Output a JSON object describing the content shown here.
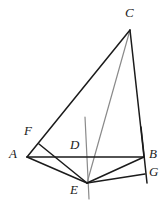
{
  "figure": {
    "type": "geometry-diagram",
    "canvas": {
      "width": 165,
      "height": 205,
      "background": "#ffffff"
    },
    "colors": {
      "stroke_dark": "#1b1b1b",
      "stroke_gray": "#8a8a8a",
      "label_color": "#1b1b1b",
      "background": "#ffffff"
    },
    "points": [
      {
        "id": "C",
        "label": "C",
        "x": 130,
        "y": 30,
        "label_x": 128,
        "label_y": 8,
        "anchor": "top"
      },
      {
        "id": "F",
        "label": "F",
        "x": 39,
        "y": 144,
        "label_x": 25,
        "label_y": 126,
        "anchor": "left"
      },
      {
        "id": "A",
        "label": "A",
        "x": 27,
        "y": 157,
        "label_x": 11,
        "label_y": 148,
        "anchor": "left"
      },
      {
        "id": "D",
        "label": "D",
        "x": 79,
        "y": 157,
        "label_x": 71,
        "label_y": 139,
        "anchor": "above"
      },
      {
        "id": "B",
        "label": "B",
        "x": 144,
        "y": 157,
        "label_x": 148,
        "label_y": 148,
        "anchor": "right"
      },
      {
        "id": "G",
        "label": "G",
        "x": 144,
        "y": 174,
        "label_x": 148,
        "label_y": 166,
        "anchor": "right"
      },
      {
        "id": "E",
        "label": "E",
        "x": 87,
        "y": 183,
        "label_x": 71,
        "label_y": 183,
        "anchor": "below-left"
      }
    ],
    "segments": [
      {
        "id": "AC",
        "from": "A",
        "to": "C",
        "color": "stroke_dark",
        "width": 1.5,
        "note": "side A to C passing through F"
      },
      {
        "id": "CB",
        "from": "C",
        "to": "B",
        "color": "stroke_dark",
        "width": 1.5,
        "note": "side C to B"
      },
      {
        "id": "AB",
        "from": "A",
        "to": "B",
        "color": "stroke_dark",
        "width": 1.5,
        "note": "base A to B through D"
      },
      {
        "id": "AE",
        "from": "A",
        "to": "E",
        "color": "stroke_dark",
        "width": 1.5,
        "note": "A down to E"
      },
      {
        "id": "FE",
        "from": "F",
        "to": "E",
        "color": "stroke_dark",
        "width": 1.5,
        "note": "F down through AB to E"
      },
      {
        "id": "EB",
        "from": "E",
        "to": "B",
        "color": "stroke_dark",
        "width": 1.5,
        "note": "E up to B"
      },
      {
        "id": "EG",
        "from": "E",
        "to": "G",
        "color": "stroke_dark",
        "width": 1.5,
        "note": "E across to G"
      },
      {
        "id": "BG",
        "from": "B",
        "to": "G",
        "color": "stroke_dark",
        "width": 1.5,
        "note": "short vertical B to G, extended"
      },
      {
        "id": "CE",
        "from": "C",
        "to": "E",
        "color": "stroke_gray",
        "width": 1.2,
        "note": "gray cevian C to E"
      }
    ],
    "extra_lines": [
      {
        "id": "vertical-through-E",
        "x1": 85,
        "y1": 117,
        "x2": 89,
        "y2": 199,
        "color": "stroke_gray",
        "width": 1.2,
        "note": "gray near-vertical auxiliary line through E"
      },
      {
        "id": "BG-extension",
        "x1": 141,
        "y1": 127,
        "x2": 147,
        "y2": 183,
        "color": "stroke_dark",
        "width": 1.5,
        "note": "dark line through B and G extended past both"
      }
    ],
    "labels": [
      "A",
      "B",
      "C",
      "D",
      "E",
      "F",
      "G"
    ]
  }
}
